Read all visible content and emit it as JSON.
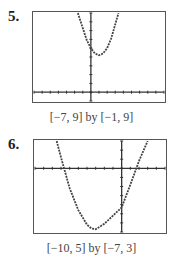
{
  "chart_data": [
    {
      "label": "5.",
      "type": "line",
      "title": "",
      "caption": "[−7, 9] by [−1, 9]",
      "xlim": [
        -7,
        9
      ],
      "ylim": [
        -1,
        9
      ],
      "xlabel": "",
      "ylabel": "",
      "grid": false,
      "series": [
        {
          "name": "parabola",
          "x": [
            -1.6,
            -1,
            -0.5,
            0,
            0.5,
            1,
            1.5,
            2,
            2.5,
            3.4
          ],
          "y": [
            9,
            7.3,
            5.9,
            5,
            4.4,
            4.2,
            4.4,
            5,
            6.1,
            9
          ]
        }
      ]
    },
    {
      "label": "6.",
      "type": "line",
      "title": "",
      "caption": "[−10, 5] by [−7, 3]",
      "xlim": [
        -10,
        5
      ],
      "ylim": [
        -7,
        3
      ],
      "xlabel": "",
      "ylabel": "",
      "grid": false,
      "series": [
        {
          "name": "parabola",
          "x": [
            -7.5,
            -7,
            -6,
            -5,
            -4,
            -3.5,
            -3,
            -2,
            -1,
            0,
            1,
            2,
            3
          ],
          "y": [
            3,
            1.2,
            -2.2,
            -4.6,
            -6.2,
            -6.6,
            -6.7,
            -6.1,
            -5.2,
            -4.3,
            -1.8,
            0.8,
            3
          ]
        }
      ]
    }
  ]
}
